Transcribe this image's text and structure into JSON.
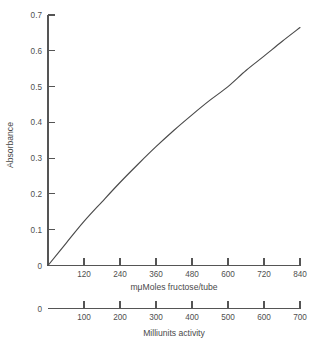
{
  "chart_data": {
    "type": "line",
    "title": "",
    "subtitle": "",
    "ylabel": "Absorbance",
    "xlabel": "mμMoles fructose/tube",
    "xlabel_secondary": "Milliunits activity",
    "ylim": [
      0,
      0.7
    ],
    "xlim": [
      0,
      840
    ],
    "xlim_secondary": [
      0,
      700
    ],
    "grid": false,
    "legend": null,
    "y_ticks": [
      0,
      0.1,
      0.2,
      0.3,
      0.4,
      0.5,
      0.6,
      0.7
    ],
    "y_ticklabels": [
      "0",
      "0.1",
      "0.2",
      "0.3",
      "0.4",
      "0.5",
      "0.6",
      "0.7"
    ],
    "x_ticks": [
      0,
      120,
      240,
      360,
      480,
      600,
      720,
      840
    ],
    "x_ticklabels": [
      "",
      "120",
      "240",
      "360",
      "480",
      "600",
      "720",
      "840"
    ],
    "x_ticks_secondary": [
      0,
      100,
      200,
      300,
      400,
      500,
      600,
      700
    ],
    "x_ticklabels_secondary": [
      "0",
      "100",
      "200",
      "300",
      "400",
      "500",
      "600",
      "700"
    ],
    "secondary_axis_origin_label": "0",
    "series": [
      {
        "name": "standard curve",
        "x": [
          0,
          60,
          120,
          180,
          240,
          300,
          360,
          420,
          480,
          540,
          600,
          660,
          720,
          780,
          840
        ],
        "values": [
          0.0,
          0.062,
          0.123,
          0.178,
          0.232,
          0.283,
          0.332,
          0.378,
          0.421,
          0.462,
          0.5,
          0.545,
          0.585,
          0.626,
          0.665
        ]
      }
    ],
    "colors": {
      "curve": "#4a4a4a",
      "axis": "#555555",
      "text": "#4a4a4a",
      "background": "#ffffff"
    }
  }
}
